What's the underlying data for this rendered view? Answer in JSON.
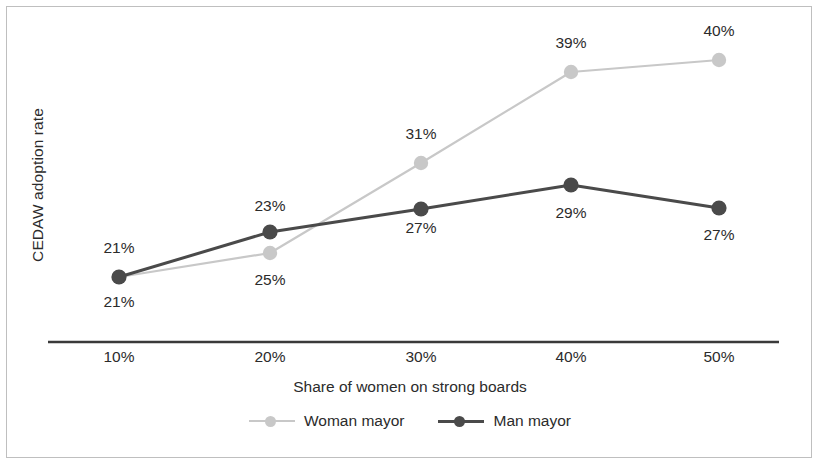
{
  "chart_data": {
    "type": "line",
    "title": "",
    "xlabel": "Share of women on strong boards",
    "ylabel": "CEDAW adoption rate",
    "categories": [
      "10%",
      "20%",
      "30%",
      "40%",
      "50%"
    ],
    "x": [
      10,
      20,
      30,
      40,
      50
    ],
    "xlim": [
      5,
      55
    ],
    "ylim": [
      18,
      42
    ],
    "grid": false,
    "legend_position": "bottom-center",
    "series": [
      {
        "name": "Woman mayor",
        "color": "#c8c8c8",
        "marker": "circle",
        "values": [
          21,
          25,
          31,
          39,
          40
        ],
        "labels": [
          "21%",
          "25%",
          "31%",
          "39%",
          "40%"
        ],
        "label_positions": [
          "below",
          "below",
          "above",
          "above",
          "above"
        ],
        "points_px": [
          {
            "x": 119,
            "y": 277
          },
          {
            "x": 270,
            "y": 253
          },
          {
            "x": 421,
            "y": 163
          },
          {
            "x": 571,
            "y": 72
          },
          {
            "x": 719,
            "y": 60
          }
        ],
        "label_px": [
          {
            "x": 119,
            "y": 293
          },
          {
            "x": 270,
            "y": 271
          },
          {
            "x": 421,
            "y": 125
          },
          {
            "x": 571,
            "y": 34
          },
          {
            "x": 719,
            "y": 22
          }
        ]
      },
      {
        "name": "Man mayor",
        "color": "#4a4a4a",
        "marker": "circle",
        "values": [
          21,
          23,
          27,
          29,
          27
        ],
        "labels": [
          "21%",
          "23%",
          "27%",
          "29%",
          "27%"
        ],
        "label_positions": [
          "above",
          "above",
          "below",
          "below",
          "below"
        ],
        "points_px": [
          {
            "x": 119,
            "y": 277
          },
          {
            "x": 270,
            "y": 232
          },
          {
            "x": 421,
            "y": 209
          },
          {
            "x": 571,
            "y": 185
          },
          {
            "x": 719,
            "y": 208
          }
        ],
        "label_px": [
          {
            "x": 119,
            "y": 239
          },
          {
            "x": 270,
            "y": 197
          },
          {
            "x": 421,
            "y": 219
          },
          {
            "x": 571,
            "y": 204
          },
          {
            "x": 719,
            "y": 226
          }
        ]
      }
    ],
    "x_tick_px": [
      119,
      270,
      421,
      571,
      719
    ],
    "axis_line": {
      "x1": 48,
      "x2": 779,
      "y": 342,
      "color": "#3a3a3a"
    }
  },
  "legend": {
    "entries": [
      {
        "label": "Woman mayor",
        "color": "#c8c8c8"
      },
      {
        "label": "Man mayor",
        "color": "#4a4a4a"
      }
    ]
  },
  "colors": {
    "woman_mayor": "#c8c8c8",
    "man_mayor": "#4a4a4a",
    "axis": "#3a3a3a",
    "text": "#2b2b2b",
    "frame": "#8a8a8a",
    "background": "#ffffff"
  }
}
